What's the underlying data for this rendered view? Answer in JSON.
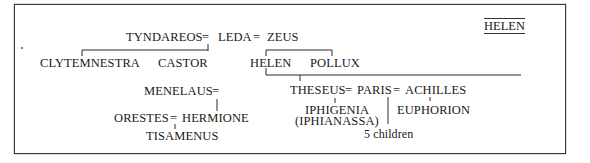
{
  "diagram": {
    "title": "HELEN",
    "type": "genealogy",
    "marriage_symbol": "=",
    "nodes": {
      "tyndareos": "TYNDAREOS",
      "leda": "LEDA",
      "zeus": "ZEUS",
      "clytemnestra": "CLYTEMNESTRA",
      "castor": "CASTOR",
      "helen": "HELEN",
      "pollux": "POLLUX",
      "menelaus": "MENELAUS",
      "orestes": "ORESTES",
      "hermione": "HERMIONE",
      "tisamenus": "TISAMENUS",
      "theseus": "THESEUS",
      "paris": "PARIS",
      "achilles": "ACHILLES",
      "iphigenia": "IPHIGENIA",
      "iphianassa": "(IPHIANASSA)",
      "euphorion": "EUPHORION",
      "five_children": "5 children"
    },
    "marriages": [
      [
        "TYNDAREOS",
        "LEDA"
      ],
      [
        "LEDA",
        "ZEUS"
      ],
      [
        "MENELAUS",
        "HELEN"
      ],
      [
        "ORESTES",
        "HERMIONE"
      ],
      [
        "THESEUS",
        "HELEN"
      ],
      [
        "PARIS",
        "HELEN"
      ],
      [
        "ACHILLES",
        "HELEN"
      ]
    ],
    "descent": [
      {
        "parents": "TYNDAREOS = LEDA",
        "children": [
          "CLYTEMNESTRA",
          "CASTOR"
        ]
      },
      {
        "parents": "LEDA = ZEUS",
        "children": [
          "HELEN",
          "POLLUX"
        ]
      },
      {
        "parents": "MENELAUS = HELEN",
        "children": [
          "HERMIONE"
        ]
      },
      {
        "parents": "ORESTES = HERMIONE",
        "children": [
          "TISAMENUS"
        ]
      },
      {
        "parents": "THESEUS = HELEN",
        "children": [
          "IPHIGENIA (IPHIANASSA)"
        ]
      },
      {
        "parents": "PARIS = HELEN",
        "children": [
          "5 children"
        ]
      },
      {
        "parents": "ACHILLES = HELEN",
        "children": [
          "EUPHORION"
        ]
      }
    ]
  }
}
